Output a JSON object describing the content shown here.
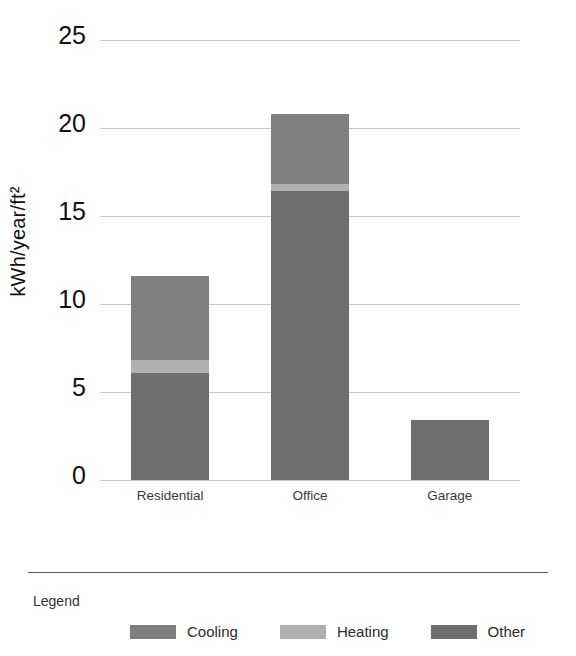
{
  "chart_data": {
    "type": "bar",
    "stacked": true,
    "title": "",
    "xlabel": "",
    "ylabel": "kWh/year/ft²",
    "categories": [
      "Residential",
      "Office",
      "Garage"
    ],
    "series": [
      {
        "name": "Other",
        "color": "#6e6e6e",
        "values": [
          6.1,
          16.4,
          3.4
        ]
      },
      {
        "name": "Heating",
        "color": "#b0b0b0",
        "values": [
          0.7,
          0.4,
          0.0
        ]
      },
      {
        "name": "Cooling",
        "color": "#808080",
        "values": [
          4.8,
          4.0,
          0.0
        ]
      }
    ],
    "totals": [
      11.6,
      20.8,
      3.4
    ],
    "yticks": [
      0,
      5,
      10,
      15,
      20,
      25
    ],
    "ytick_labels": [
      "0",
      "5",
      "10",
      "15",
      "20",
      "25"
    ],
    "ylim": [
      0,
      25
    ],
    "grid": true,
    "gridline_color": "#c9c9c9",
    "legend_position": "bottom",
    "legend_title": "Legend",
    "legend_entries": [
      {
        "label": "Cooling",
        "color": "#808080"
      },
      {
        "label": "Heating",
        "color": "#b0b0b0"
      },
      {
        "label": "Other",
        "color": "#6e6e6e"
      }
    ]
  }
}
